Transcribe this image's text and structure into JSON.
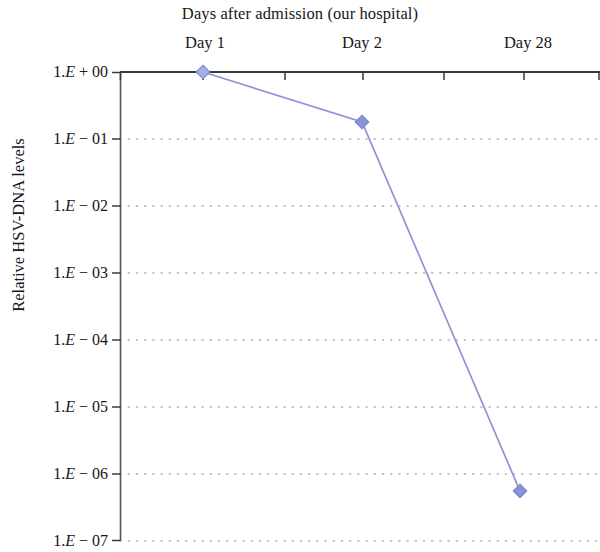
{
  "chart_data": {
    "type": "line",
    "title": "Days after admission (our hospital)",
    "xlabel": "",
    "ylabel": "Relative HSV-DNA levels",
    "categories": [
      "Day 1",
      "Day 2",
      "Day 28"
    ],
    "x_tick_labels": [
      "Day 1",
      "Day 2",
      "Day 28"
    ],
    "y_tick_labels": [
      "1.E + 00",
      "1.E − 01",
      "1.E − 02",
      "1.E − 03",
      "1.E − 04",
      "1.E − 05",
      "1.E − 06",
      "1.E − 07"
    ],
    "y_tick_values": [
      1,
      0.1,
      0.01,
      0.001,
      0.0001,
      1e-05,
      1e-06,
      1e-07
    ],
    "yscale": "log",
    "ylim": [
      1e-07,
      1
    ],
    "grid": true,
    "grid_style": "dotted",
    "legend": "none",
    "series": [
      {
        "name": "Relative HSV-DNA levels",
        "marker": "diamond",
        "color": "#8b93d6",
        "values": [
          1.0,
          0.16,
          6e-07
        ],
        "value_labels": [
          "1.E + 00",
          "1.6E − 01",
          "6.0E − 07"
        ]
      }
    ]
  },
  "axis": {
    "line_color": "#3d3d3d",
    "grid_color": "#b8b8b8",
    "tick_color": "#3d3d3d"
  }
}
